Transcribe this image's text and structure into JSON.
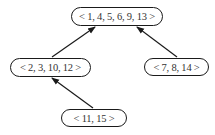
{
  "diagram": {
    "type": "tree",
    "nodes": [
      {
        "id": "root",
        "label": "< 1, 4, 5, 6, 9, 13 >",
        "x": 71,
        "y": 7,
        "w": 92,
        "h": 19
      },
      {
        "id": "left",
        "label": "< 2, 3, 10, 12 >",
        "x": 10,
        "y": 58,
        "w": 81,
        "h": 19
      },
      {
        "id": "right",
        "label": "< 7, 8, 14 >",
        "x": 144,
        "y": 58,
        "w": 65,
        "h": 18
      },
      {
        "id": "bottom",
        "label": "< 11, 15 >",
        "x": 61,
        "y": 109,
        "w": 66,
        "h": 18
      }
    ],
    "edges": [
      {
        "from": "left",
        "to": "root"
      },
      {
        "from": "right",
        "to": "root"
      },
      {
        "from": "bottom",
        "to": "left"
      }
    ],
    "colors": {
      "stroke": "#1a1a1a",
      "text": "#333333",
      "background": "#ffffff"
    }
  }
}
